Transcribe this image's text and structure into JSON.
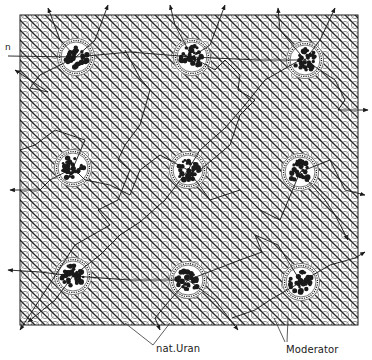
{
  "diagram": {
    "type": "reactor-lattice",
    "labels": {
      "neutron": "n",
      "fuel": "nat.Uran",
      "moderator": "Moderator"
    },
    "colors": {
      "ink": "#1a1a1a",
      "background": "#ffffff",
      "hatch": "#3a3a3a"
    },
    "frame": {
      "x": 20,
      "y": 15,
      "width": 338,
      "height": 310
    },
    "fuel_elements": [
      {
        "id": "fuel-r1c1",
        "cx": 76,
        "cy": 57
      },
      {
        "id": "fuel-r1c2",
        "cx": 192,
        "cy": 57
      },
      {
        "id": "fuel-r1c3",
        "cx": 305,
        "cy": 60
      },
      {
        "id": "fuel-r2c1",
        "cx": 73,
        "cy": 168
      },
      {
        "id": "fuel-r2c2",
        "cx": 188,
        "cy": 170
      },
      {
        "id": "fuel-r2c3",
        "cx": 300,
        "cy": 172
      },
      {
        "id": "fuel-r3c1",
        "cx": 73,
        "cy": 276
      },
      {
        "id": "fuel-r3c2",
        "cx": 188,
        "cy": 280
      },
      {
        "id": "fuel-r3c3",
        "cx": 301,
        "cy": 282
      }
    ]
  }
}
